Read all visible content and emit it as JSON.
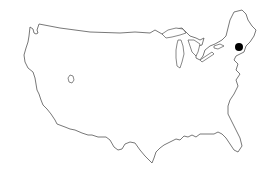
{
  "map": {
    "type": "outline",
    "region": "contiguous-united-states",
    "background": "#ffffff",
    "outline_color": "#555555",
    "marker_color": "#000000",
    "markers": [
      {
        "name": "location-marker",
        "x": 239,
        "y": 47,
        "r": 4
      }
    ]
  }
}
